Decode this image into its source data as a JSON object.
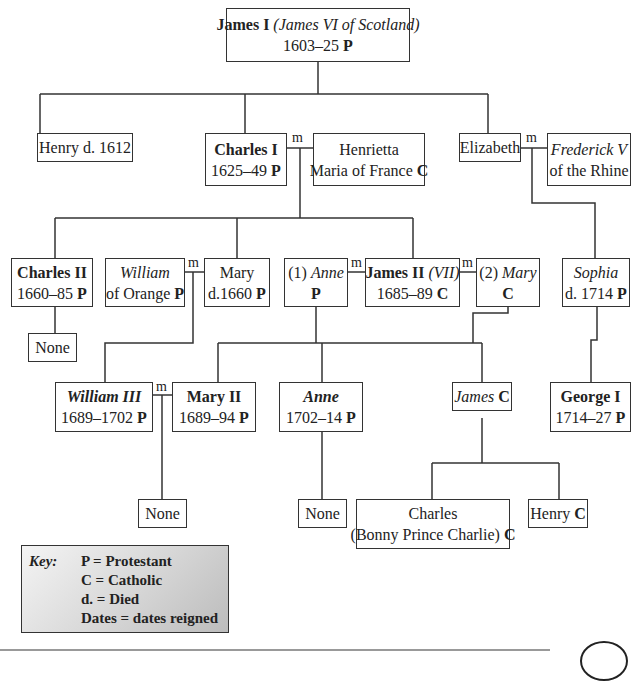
{
  "people": {
    "james_i": {
      "name": "James I",
      "alt": "(James VI of Scotland)",
      "dates": "1603–25",
      "religion": "P"
    },
    "henry_1612": {
      "name": "Henry",
      "died": "d. 1612"
    },
    "charles_i": {
      "name": "Charles I",
      "dates": "1625–49",
      "religion": "P"
    },
    "henrietta": {
      "line1": "Henrietta",
      "line2": "Maria of France",
      "religion": "C"
    },
    "elizabeth": {
      "name": "Elizabeth"
    },
    "frederick": {
      "line1": "Frederick V",
      "line2": "of the Rhine"
    },
    "charles_ii": {
      "name": "Charles II",
      "dates": "1660–85",
      "religion": "P"
    },
    "william_orange": {
      "line1": "William",
      "line2": "of Orange",
      "religion": "P"
    },
    "mary_1660": {
      "name": "Mary",
      "died": "d.1660",
      "religion": "P"
    },
    "anne_hyde": {
      "prefix": "(1)",
      "name": "Anne",
      "religion": "P"
    },
    "james_ii": {
      "name": "James II",
      "alt": "(VII)",
      "dates": "1685–89",
      "religion": "C"
    },
    "mary_modena": {
      "prefix": "(2)",
      "name": "Mary",
      "religion": "C"
    },
    "sophia": {
      "name": "Sophia",
      "died": "d. 1714",
      "religion": "P"
    },
    "william_iii": {
      "name": "William III",
      "dates": "1689–1702",
      "religion": "P"
    },
    "mary_ii": {
      "name": "Mary II",
      "dates": "1689–94",
      "religion": "P"
    },
    "anne": {
      "name": "Anne",
      "dates": "1702–14",
      "religion": "P"
    },
    "james_old": {
      "name": "James",
      "religion": "C"
    },
    "george_i": {
      "name": "George I",
      "dates": "1714–27",
      "religion": "P"
    },
    "charles_bpc": {
      "line1": "Charles",
      "line2": "(Bonny Prince Charlie)",
      "religion": "C"
    },
    "henry_c": {
      "name": "Henry",
      "religion": "C"
    }
  },
  "none_label": "None",
  "married_label": "m",
  "key": {
    "label": "Key:",
    "items": [
      "P = Protestant",
      "C = Catholic",
      "d. = Died",
      "Dates = dates reigned"
    ]
  }
}
